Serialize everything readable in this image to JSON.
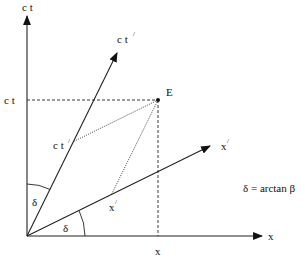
{
  "diagram": {
    "axes": {
      "ct_label": "c t",
      "x_label": "x",
      "ct_prime_label": "c t",
      "ct_prime_prime": "/",
      "x_prime_label": "x",
      "x_prime_prime": "/"
    },
    "event": {
      "label": "E"
    },
    "projections": {
      "ct_value_label": "c t",
      "x_value_label": "x",
      "ct_prime_value_label": "c t",
      "ct_prime_value_prime": "/",
      "x_prime_value_label": "x",
      "x_prime_value_prime": "/"
    },
    "angles": {
      "delta_upper": "δ",
      "delta_lower": "δ"
    },
    "formula": "δ = arctan β",
    "colors": {
      "ink": "#222222",
      "background": "#ffffff"
    }
  }
}
